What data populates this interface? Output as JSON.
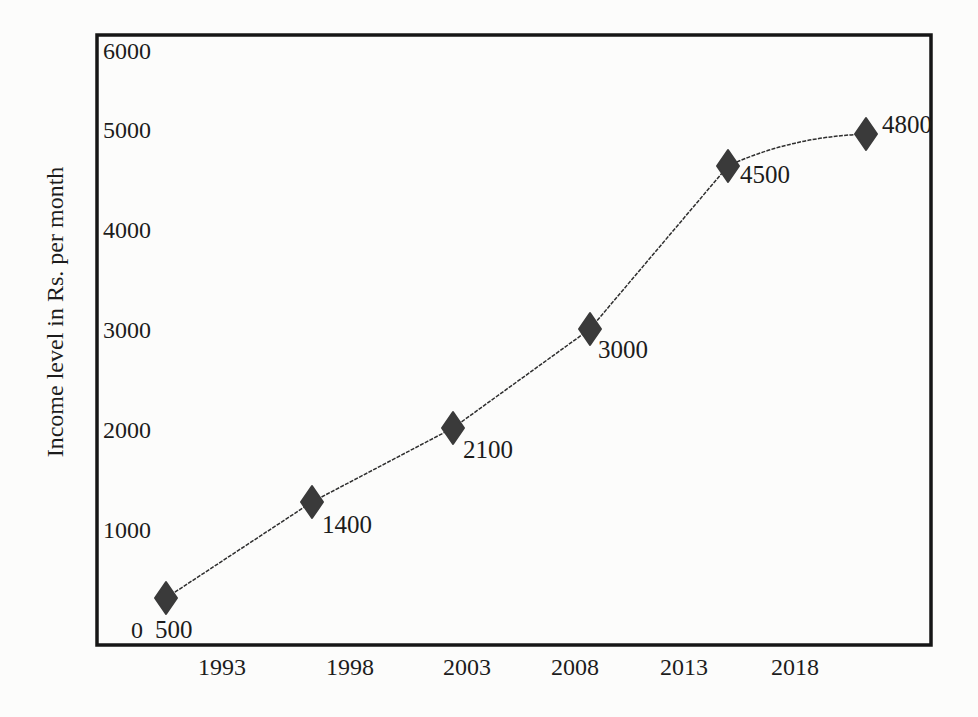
{
  "chart_data": {
    "type": "line",
    "title": "",
    "xlabel": "",
    "ylabel": "Income level in Rs. per month",
    "x": [
      "1993",
      "1998",
      "2003",
      "2008",
      "2013",
      "2018"
    ],
    "series": [
      {
        "name": "Income level",
        "values": [
          500,
          1400,
          2100,
          3000,
          4500,
          4800
        ]
      }
    ],
    "point_labels": [
      "500",
      "1400",
      "2100",
      "3000",
      "4500",
      "4800"
    ],
    "y_ticks": [
      0,
      1000,
      2000,
      3000,
      4000,
      5000,
      6000
    ],
    "ylim": [
      0,
      6000
    ],
    "grid": false,
    "legend": "none",
    "marker_shape": "diamond",
    "line_style": "thin",
    "colors": {
      "line": "#2e2e2e",
      "marker": "#3a3a3a",
      "text": "#1c1c1c",
      "frame": "#161616",
      "background": "#fcfcfb"
    }
  }
}
